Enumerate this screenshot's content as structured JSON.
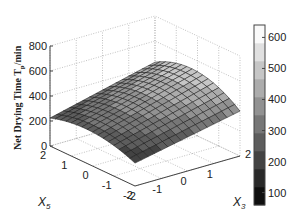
{
  "chart_data": {
    "type": "surface",
    "title": "",
    "xlabel": "X_3",
    "ylabel": "X_5",
    "zlabel": "Net Drying Time  T_p/min",
    "x_axis": {
      "name": "X3",
      "range": [
        -2,
        2
      ],
      "ticks": [
        -2,
        -1,
        0,
        1,
        2
      ]
    },
    "y_axis": {
      "name": "X5",
      "range": [
        -2,
        2
      ],
      "ticks": [
        -2,
        -1,
        0,
        1,
        2
      ]
    },
    "z_axis": {
      "range": [
        0,
        800
      ],
      "ticks": [
        0,
        200,
        400,
        600,
        800
      ]
    },
    "grid": true,
    "grid_points": [
      -2,
      -1.75,
      -1.5,
      -1.25,
      -1,
      -0.75,
      -0.5,
      -0.25,
      0,
      0.25,
      0.5,
      0.75,
      1,
      1.25,
      1.5,
      1.75,
      2
    ],
    "model": {
      "description": "Net drying time rises with X3 and is parabolic in X5 with a maximum near X5≈0.3",
      "corner_values": {
        "X3=-2,X5=2": 70,
        "X3=-2,X5=-2": 60,
        "X3=2,X5=2": 490,
        "X3=2,X5=-2": 470,
        "X3=2,X5=0.3": 640,
        "X3=-2,X5=0.3": 150
      }
    },
    "colorbar": {
      "ticks": [
        100,
        200,
        300,
        400,
        500,
        600
      ],
      "range": [
        60,
        640
      ],
      "colormap": "gray",
      "levels": 10
    }
  },
  "labels": {
    "x_label_main": "X",
    "x_label_sub": "3",
    "y_label_main": "X",
    "y_label_sub": "5",
    "z_label_main": "Net Drying Time  T",
    "z_label_sub": "p",
    "z_label_tail": "/min"
  }
}
